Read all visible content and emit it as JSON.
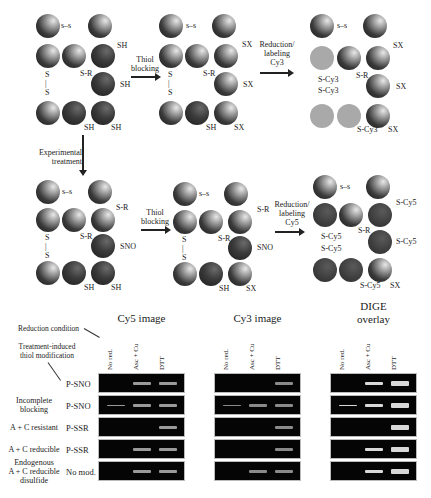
{
  "panel_A": {
    "step_labels": {
      "thiol_blocking": [
        "Thiol",
        "blocking"
      ],
      "reduction_cy3": [
        "Reduction/",
        "labeling",
        "Cy3"
      ],
      "reduction_cy5": [
        "Reduction/",
        "labeling",
        "Cy5"
      ],
      "experimental_treatment": [
        "Experimental",
        "treatment"
      ]
    },
    "disulfide_symbol": "s–s",
    "vertical_disulfide": [
      "S",
      "|",
      "S"
    ],
    "row1": {
      "state1": {
        "l1": "SH",
        "l2": "S-R",
        "l3": "SH",
        "l4": "SH",
        "l5": "SH"
      },
      "state2": {
        "l1": "SX",
        "l2": "S-R",
        "l3": "SX",
        "l4": "SH",
        "l5": "SX"
      },
      "state3": {
        "l1": "SX",
        "l2": "S-R",
        "l3": "SX",
        "l4": "S-Cy3",
        "l5": "SX",
        "l6": "S-Cy3",
        "l7": "S-Cy3"
      }
    },
    "row2": {
      "state1": {
        "l1": "S-R",
        "l2": "S-R",
        "l3": "SNO",
        "l4": "SH",
        "l5": "SH"
      },
      "state2": {
        "l1": "S-R",
        "l2": "S-R",
        "l3": "SNO",
        "l4": "SH",
        "l5": "SX"
      },
      "state3": {
        "l1": "S-Cy5",
        "l2": "S-R",
        "l3": "S-Cy5",
        "l4": "S-Cy5",
        "l5": "SX",
        "l6": "S-Cy5",
        "l7": "S-Cy5"
      }
    }
  },
  "panel_B": {
    "annotations": {
      "reduction_condition": "Reduction condition",
      "treatment_induced": [
        "Treatment-induced",
        "thiol modification"
      ]
    },
    "gel_titles": {
      "cy5": "Cy5 image",
      "cy3": "Cy3 image",
      "dige": [
        "DIGE",
        "overlay"
      ]
    },
    "lanes": [
      "No red.",
      "Asc + Cu",
      "DTT"
    ],
    "rows": [
      {
        "category": [
          ""
        ],
        "modification": "P-SNO"
      },
      {
        "category": [
          "Incomplete",
          "blocking"
        ],
        "modification": "P-SNO"
      },
      {
        "category": [
          "A + C resistant"
        ],
        "modification": "P-SSR"
      },
      {
        "category": [
          "A + C reducible"
        ],
        "modification": "P-SSR"
      },
      {
        "category": [
          "Endogenous",
          "A + C reducible",
          "disulfide"
        ],
        "modification": "No mod."
      }
    ],
    "band_colors": {
      "cy5": "#9a9a9a",
      "cy3": "#8a8a8a",
      "dige": "#d8d8d8"
    },
    "bands": {
      "cy5": [
        [
          0,
          1,
          1
        ],
        [
          1,
          1,
          1
        ],
        [
          0,
          0,
          1
        ],
        [
          0,
          1,
          1
        ],
        [
          0,
          1,
          1
        ]
      ],
      "cy3": [
        [
          0,
          0,
          1
        ],
        [
          1,
          1,
          1
        ],
        [
          0,
          0,
          1
        ],
        [
          0,
          0,
          1
        ],
        [
          0,
          1,
          1
        ]
      ],
      "dige": [
        [
          0,
          1,
          1
        ],
        [
          1,
          1,
          1
        ],
        [
          0,
          0,
          1
        ],
        [
          0,
          1,
          1
        ],
        [
          0,
          1,
          1
        ]
      ]
    }
  }
}
